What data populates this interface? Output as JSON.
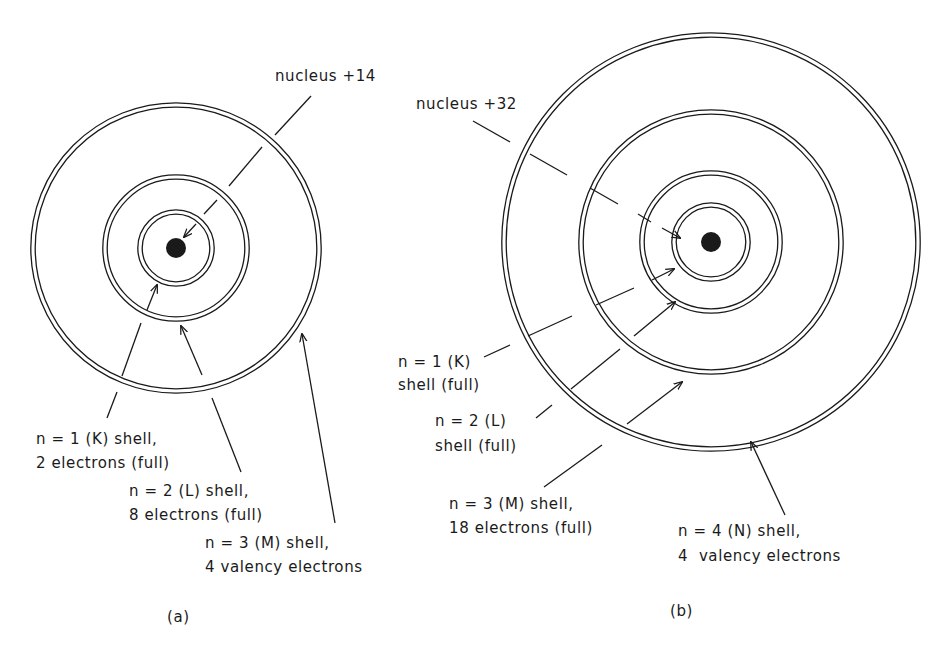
{
  "colors": {
    "ink": "#1a1a1a",
    "paper": "#ffffff"
  },
  "diagram_a": {
    "caption": "(a)",
    "center": [
      176,
      248
    ],
    "nucleus": {
      "label": "nucleus +14",
      "radius": 10
    },
    "shells": [
      {
        "radius": 36,
        "line1": "n = 1 (K) shell,",
        "line2": "2 electrons (full)"
      },
      {
        "radius": 71,
        "line1": "n = 2 (L) shell,",
        "line2": "8 electrons (full)"
      },
      {
        "radius": 143,
        "line1": "n = 3 (M) shell,",
        "line2": "4 valency electrons"
      }
    ]
  },
  "diagram_b": {
    "caption": "(b)",
    "center": [
      711,
      242
    ],
    "nucleus": {
      "label": "nucleus +32",
      "radius": 10
    },
    "shells": [
      {
        "radius": 37,
        "line1": "n = 1 (K)",
        "line2": "shell (full)"
      },
      {
        "radius": 69,
        "line1": "n = 2 (L)",
        "line2": "shell (full)"
      },
      {
        "radius": 130,
        "line1": "n = 3 (M) shell,",
        "line2": "18 electrons (full)"
      },
      {
        "radius": 207,
        "line1": "n = 4 (N) shell,",
        "line2": "4  valency electrons"
      }
    ]
  }
}
